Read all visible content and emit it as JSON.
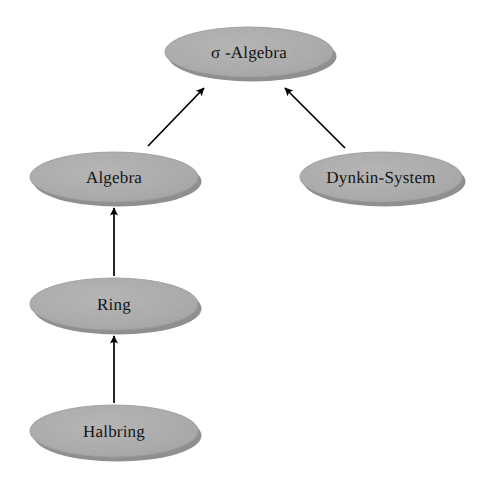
{
  "diagram": {
    "background_color": "#ffffff",
    "node_fill_color": "#a9a9a9",
    "node_shadow_color": "#8f8f8f",
    "node_edge_color": "#9a9a9a",
    "arrow_color": "#000000",
    "label_color": "#141414",
    "nodes": [
      {
        "id": "sigma-algebra",
        "label": "σ -Algebra",
        "cx": 249,
        "cy": 52,
        "rx": 84,
        "ry": 25
      },
      {
        "id": "algebra",
        "label": "Algebra",
        "cx": 114,
        "cy": 177,
        "rx": 84,
        "ry": 25
      },
      {
        "id": "dynkin-system",
        "label": "Dynkin-System",
        "cx": 381,
        "cy": 177,
        "rx": 81,
        "ry": 25
      },
      {
        "id": "ring",
        "label": "Ring",
        "cx": 114,
        "cy": 304,
        "rx": 84,
        "ry": 26
      },
      {
        "id": "halbring",
        "label": "Halbring",
        "cx": 114,
        "cy": 431,
        "rx": 84,
        "ry": 26
      }
    ],
    "edges": [
      {
        "id": "algebra-to-sigma-algebra",
        "from": "algebra",
        "to": "sigma-algebra",
        "x1": 148,
        "y1": 146,
        "x2": 204,
        "y2": 88
      },
      {
        "id": "dynkin-system-to-sigma-algebra",
        "from": "dynkin-system",
        "to": "sigma-algebra",
        "x1": 345,
        "y1": 148,
        "x2": 285,
        "y2": 88
      },
      {
        "id": "ring-to-algebra",
        "from": "ring",
        "to": "algebra",
        "x1": 114,
        "y1": 276,
        "x2": 114,
        "y2": 208
      },
      {
        "id": "halbring-to-ring",
        "from": "halbring",
        "to": "ring",
        "x1": 114,
        "y1": 403,
        "x2": 114,
        "y2": 336
      }
    ]
  }
}
